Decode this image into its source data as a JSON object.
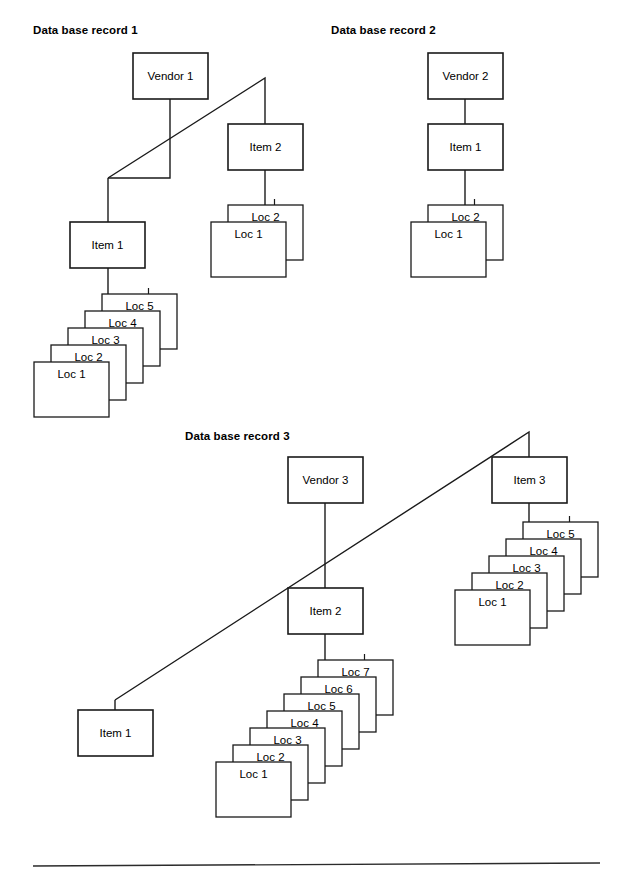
{
  "page": {
    "width": 637,
    "height": 873,
    "background": "#ffffff",
    "ink_color": "#1a1a1a",
    "footer_rule": {
      "x1": 33,
      "y1": 866,
      "x2": 600,
      "y2": 863
    }
  },
  "diagram": {
    "type": "hierarchical-record-tree",
    "card": {
      "width": 75,
      "height": 55,
      "offset_x": 17,
      "offset_y": -17
    },
    "records": [
      {
        "id": "record-1",
        "title": "Data base record 1",
        "title_pos": {
          "x": 33,
          "y": 34
        },
        "nodes": [
          {
            "name": "vendor-1",
            "label": "Vendor 1",
            "x": 133,
            "y": 53,
            "w": 75,
            "h": 46
          },
          {
            "name": "item-1",
            "label": "Item 1",
            "x": 70,
            "y": 222,
            "w": 75,
            "h": 46
          },
          {
            "name": "item-2",
            "label": "Item 2",
            "x": 228,
            "y": 124,
            "w": 75,
            "h": 46
          }
        ],
        "stacks": [
          {
            "name": "loc-stack-item-1",
            "anchor_x": 108,
            "anchor_y": 268,
            "base_x": 34,
            "base_y": 362,
            "cards": [
              "Loc 1",
              "Loc 2",
              "Loc 3",
              "Loc 4",
              "Loc 5"
            ]
          },
          {
            "name": "loc-stack-item-2",
            "anchor_x": 265,
            "anchor_y": 170,
            "base_x": 211,
            "base_y": 222,
            "cards": [
              "Loc 1",
              "Loc 2"
            ]
          }
        ],
        "connectors": [
          {
            "name": "vendor-1-to-item-2",
            "points": "170,99 170,178 108,178"
          },
          {
            "name": "vendor-1-diagonal-to-item-2",
            "points": "108,178 265,78 265,124"
          },
          {
            "name": "vendor-1-to-item-1",
            "points": "108,178 108,222"
          },
          {
            "name": "item-2-to-locs",
            "points": "265,170 265,205"
          },
          {
            "name": "item-1-to-locs",
            "points": "108,268 108,305"
          }
        ]
      },
      {
        "id": "record-2",
        "title": "Data base record 2",
        "title_pos": {
          "x": 331,
          "y": 34
        },
        "nodes": [
          {
            "name": "vendor-2",
            "label": "Vendor 2",
            "x": 428,
            "y": 53,
            "w": 75,
            "h": 46
          },
          {
            "name": "item-1",
            "label": "Item 1",
            "x": 428,
            "y": 124,
            "w": 75,
            "h": 46
          }
        ],
        "stacks": [
          {
            "name": "loc-stack-item-1",
            "anchor_x": 465,
            "anchor_y": 170,
            "base_x": 411,
            "base_y": 222,
            "cards": [
              "Loc 1",
              "Loc 2"
            ]
          }
        ],
        "connectors": [
          {
            "name": "vendor-2-to-item-1",
            "points": "465,99 465,124"
          },
          {
            "name": "item-1-to-locs",
            "points": "465,170 465,205"
          }
        ]
      },
      {
        "id": "record-3",
        "title": "Data base record 3",
        "title_pos": {
          "x": 185,
          "y": 440
        },
        "nodes": [
          {
            "name": "vendor-3",
            "label": "Vendor 3",
            "x": 288,
            "y": 457,
            "w": 75,
            "h": 46
          },
          {
            "name": "item-1",
            "label": "Item 1",
            "x": 78,
            "y": 710,
            "w": 75,
            "h": 46
          },
          {
            "name": "item-2",
            "label": "Item 2",
            "x": 288,
            "y": 588,
            "w": 75,
            "h": 46
          },
          {
            "name": "item-3",
            "label": "Item 3",
            "x": 492,
            "y": 457,
            "w": 75,
            "h": 46
          }
        ],
        "stacks": [
          {
            "name": "loc-stack-item-2",
            "anchor_x": 325,
            "anchor_y": 634,
            "base_x": 216,
            "base_y": 762,
            "cards": [
              "Loc 1",
              "Loc 2",
              "Loc 3",
              "Loc 4",
              "Loc 5",
              "Loc 6",
              "Loc 7"
            ]
          },
          {
            "name": "loc-stack-item-3",
            "anchor_x": 529,
            "anchor_y": 503,
            "base_x": 455,
            "base_y": 590,
            "cards": [
              "Loc 1",
              "Loc 2",
              "Loc 3",
              "Loc 4",
              "Loc 5"
            ]
          }
        ],
        "connectors": [
          {
            "name": "vendor-3-to-item-2",
            "points": "325,503 325,588"
          },
          {
            "name": "vendor-3-diagonal-to-item-3",
            "points": "115,700 529,432 529,457"
          },
          {
            "name": "vendor-3-to-item-1",
            "points": "115,700 115,710"
          },
          {
            "name": "item-2-to-locs",
            "points": "325,634 325,700"
          },
          {
            "name": "item-3-to-locs",
            "points": "529,503 529,560"
          }
        ]
      }
    ]
  }
}
